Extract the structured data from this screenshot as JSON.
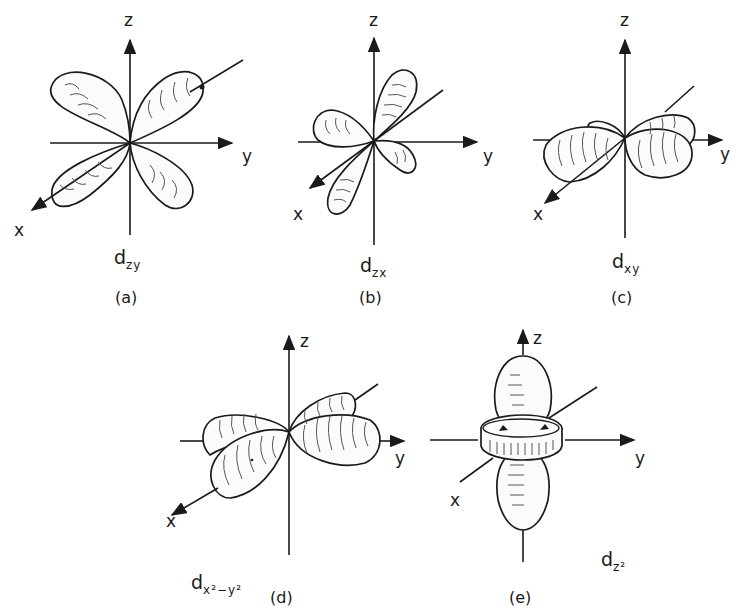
{
  "figure": {
    "panels": [
      {
        "id": "a",
        "caption": "(a)",
        "orbital": {
          "base": "d",
          "subscript": "zy",
          "sub_html": "zy"
        },
        "axes": {
          "z": "z",
          "y": "y",
          "x": "x"
        }
      },
      {
        "id": "b",
        "caption": "(b)",
        "orbital": {
          "base": "d",
          "subscript": "zx",
          "sub_html": "zx"
        },
        "axes": {
          "z": "z",
          "y": "y",
          "x": "x"
        }
      },
      {
        "id": "c",
        "caption": "(c)",
        "orbital": {
          "base": "d",
          "subscript": "xy",
          "sub_html": "xy"
        },
        "axes": {
          "z": "z",
          "y": "y",
          "x": "x"
        }
      },
      {
        "id": "d",
        "caption": "(d)",
        "orbital": {
          "base": "d",
          "subscript": "x²−y²"
        },
        "axes": {
          "z": "z",
          "y": "y",
          "x": "x"
        }
      },
      {
        "id": "e",
        "caption": "(e)",
        "orbital": {
          "base": "d",
          "subscript": "z²"
        },
        "axes": {
          "z": "z",
          "y": "y",
          "x": "x"
        }
      }
    ]
  },
  "colors": {
    "ink": "#1a1a1a",
    "background": "#ffffff",
    "hatch": "#555555"
  }
}
